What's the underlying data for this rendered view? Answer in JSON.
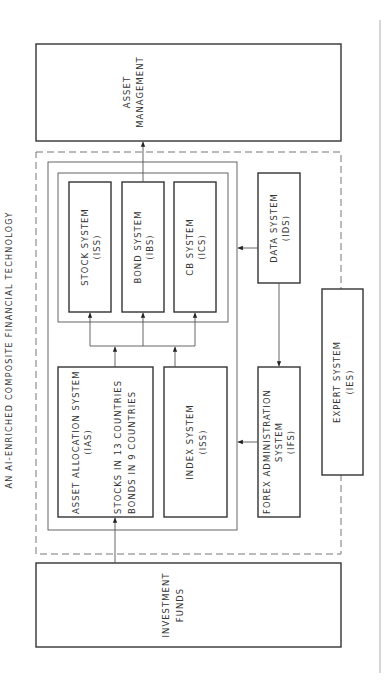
{
  "title": "AN AI-ENRICHED COMPOSITE FINANCIAL TECHNOLOGY",
  "nodes": {
    "asset_management": {
      "line1": "ASSET",
      "line2": "MANAGEMENT"
    },
    "stock_system": {
      "line1": "STOCK SYSTEM",
      "line2": "(ISS)"
    },
    "bond_system": {
      "line1": "BOND SYSTEM",
      "line2": "(IBS)"
    },
    "cb_system": {
      "line1": "CB SYSTEM",
      "line2": "(ICS)"
    },
    "asset_allocation": {
      "line1": "ASSET ALLOCATION SYSTEM",
      "line2": "(IAS)",
      "line3": "STOCKS IN 13 COUNTRIES",
      "line4": "BONDS IN 9 COUNTRIES"
    },
    "index_system": {
      "line1": "INDEX SYSTEM",
      "line2": "(ISS)"
    },
    "data_system": {
      "line1": "DATA SYSTEM",
      "line2": "(IDS)"
    },
    "forex_system": {
      "line1": "FOREX ADMINISTRATION",
      "line2": "SYSTEM",
      "line3": "(IFS)"
    },
    "expert_system": {
      "line1": "EXPERT SYSTEM",
      "line2": "(IES)"
    },
    "investment_funds": {
      "line1": "INVESTMENT",
      "line2": "FUNDS"
    }
  },
  "edges": [
    {
      "from": "investment_funds",
      "to": "asset_allocation"
    },
    {
      "from": "asset_allocation",
      "to": "stock_system"
    },
    {
      "from": "asset_allocation",
      "to": "bond_system"
    },
    {
      "from": "asset_allocation",
      "to": "cb_system"
    },
    {
      "from": "index_system",
      "to": "stock_system"
    },
    {
      "from": "index_system",
      "to": "bond_system"
    },
    {
      "from": "index_system",
      "to": "cb_system"
    },
    {
      "from": "bond_system",
      "to": "asset_management"
    },
    {
      "from": "data_system",
      "to": "subsystems_container"
    },
    {
      "from": "data_system",
      "to": "forex_system"
    },
    {
      "from": "forex_system",
      "to": "subsystems_container"
    }
  ],
  "colors": {
    "stroke": "#333333",
    "background": "#ffffff"
  }
}
